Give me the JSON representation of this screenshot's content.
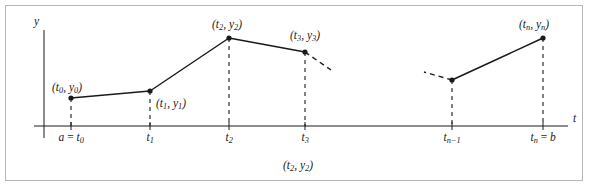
{
  "figure": {
    "title": "",
    "caption": "(t₂, y₂)",
    "frame_color": "#b6b6b6",
    "ink_color": "#1a1a1a",
    "background": "#ffffff"
  },
  "axes": {
    "x_label": "t",
    "y_label": "y",
    "x_axis_y_px": 126,
    "y_axis_x_px": 44,
    "x_start_px": 34,
    "x_end_px": 568,
    "y_top_px": 30,
    "y_bottom_px": 138
  },
  "tick_labels": [
    {
      "id": "t0",
      "text_a": "a",
      "eq": "=",
      "text_b": "t₀",
      "x_px": 71
    },
    {
      "id": "t1",
      "text_b": "t₁",
      "x_px": 150
    },
    {
      "id": "t2",
      "text_b": "t₂",
      "x_px": 229
    },
    {
      "id": "t3",
      "text_b": "t₃",
      "x_px": 305
    },
    {
      "id": "tn1",
      "text_b": "tₙ₋₁",
      "x_px": 452
    },
    {
      "id": "tn",
      "text_a": "tₙ",
      "eq": "=",
      "text_b": "b",
      "x_px": 543
    }
  ],
  "point_labels": [
    {
      "id": "p0",
      "text": "(t₀, y₀)",
      "x_px": 52,
      "y_px": 82
    },
    {
      "id": "p1",
      "text": "(t₁, y₁)",
      "x_px": 156,
      "y_px": 98
    },
    {
      "id": "p2",
      "text": "(t₂, y₂)",
      "x_px": 212,
      "y_px": 19
    },
    {
      "id": "p3",
      "text": "(t₃, y₃)",
      "x_px": 290,
      "y_px": 30
    },
    {
      "id": "pn",
      "text": "(tₙ, yₙ)",
      "x_px": 519,
      "y_px": 19
    }
  ],
  "chart_data": {
    "type": "line",
    "title": "",
    "xlabel": "t",
    "ylabel": "y",
    "grid": false,
    "legend": "none",
    "x_px": [
      71,
      150,
      229,
      305,
      452,
      543
    ],
    "y_px": [
      98,
      91,
      38,
      52,
      80,
      38
    ],
    "categories": [
      "t₀",
      "t₁",
      "t₂",
      "t₃",
      "tₙ₋₁",
      "tₙ"
    ],
    "series": [
      {
        "name": "y(t)",
        "points": [
          {
            "x_label": "t₀",
            "x_px": 71,
            "y_px": 98
          },
          {
            "x_label": "t₁",
            "x_px": 150,
            "y_px": 91
          },
          {
            "x_label": "t₂",
            "x_px": 229,
            "y_px": 38
          },
          {
            "x_label": "t₃",
            "x_px": 305,
            "y_px": 52
          },
          {
            "x_label": "tₙ₋₁",
            "x_px": 452,
            "y_px": 80
          },
          {
            "x_label": "tₙ",
            "x_px": 543,
            "y_px": 38
          }
        ]
      }
    ],
    "solid_segments": [
      [
        71,
        98,
        150,
        91
      ],
      [
        150,
        91,
        229,
        38
      ],
      [
        229,
        38,
        305,
        52
      ],
      [
        452,
        80,
        543,
        38
      ]
    ],
    "dashed_stubs": [
      [
        305,
        52,
        331,
        70
      ],
      [
        452,
        80,
        424,
        72
      ]
    ],
    "drop_lines": [
      [
        71,
        98,
        71,
        126
      ],
      [
        150,
        91,
        150,
        126
      ],
      [
        229,
        38,
        229,
        126
      ],
      [
        305,
        52,
        305,
        126
      ],
      [
        452,
        80,
        452,
        126
      ],
      [
        543,
        38,
        543,
        126
      ]
    ]
  }
}
